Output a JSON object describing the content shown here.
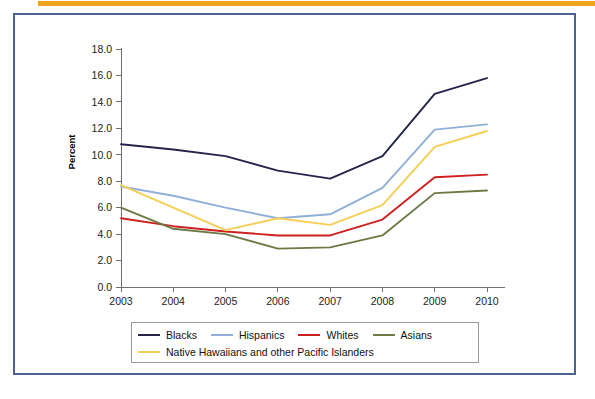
{
  "figure": {
    "accent_rule_color": "#f2a31c",
    "frame_color": "#4f6391",
    "background": "#ffffff"
  },
  "chart_data": {
    "type": "line",
    "title": "",
    "subtitle": "",
    "xlabel": "",
    "ylabel": "Percent",
    "categories": [
      "2003",
      "2004",
      "2005",
      "2006",
      "2007",
      "2008",
      "2009",
      "2010"
    ],
    "x": [
      2003,
      2004,
      2005,
      2006,
      2007,
      2008,
      2009,
      2010
    ],
    "ylim": [
      0.0,
      18.0
    ],
    "ytick_step": 2.0,
    "yticks": [
      "0.0",
      "2.0",
      "4.0",
      "6.0",
      "8.0",
      "10.0",
      "12.0",
      "14.0",
      "16.0",
      "18.0"
    ],
    "ytick_values": [
      0.0,
      2.0,
      4.0,
      6.0,
      8.0,
      10.0,
      12.0,
      14.0,
      16.0,
      18.0
    ],
    "grid": false,
    "legend_position": "bottom",
    "series": [
      {
        "name": "Blacks",
        "color": "#25254b",
        "values": [
          10.8,
          10.4,
          9.9,
          8.8,
          8.2,
          9.9,
          14.6,
          15.8
        ]
      },
      {
        "name": "Hispanics",
        "color": "#90b0d8",
        "values": [
          7.6,
          6.9,
          6.0,
          5.2,
          5.5,
          7.5,
          11.9,
          12.3
        ]
      },
      {
        "name": "Whites",
        "color": "#cf2020",
        "values": [
          5.2,
          4.6,
          4.2,
          3.9,
          3.9,
          5.1,
          8.3,
          8.5
        ]
      },
      {
        "name": "Asians",
        "color": "#6b7a45",
        "values": [
          6.0,
          4.4,
          4.0,
          2.9,
          3.0,
          3.9,
          7.1,
          7.3
        ]
      },
      {
        "name": "Native Hawaiians and other Pacific Islanders",
        "color": "#f5cf55",
        "values": [
          7.7,
          6.0,
          4.3,
          5.2,
          4.7,
          6.2,
          10.6,
          11.8
        ]
      }
    ]
  },
  "legend": {
    "row1": [
      {
        "label": "Blacks",
        "color": "#25254b"
      },
      {
        "label": "Hispanics",
        "color": "#90b0d8"
      },
      {
        "label": "Whites",
        "color": "#cf2020"
      },
      {
        "label": "Asians",
        "color": "#6b7a45"
      }
    ],
    "row2": [
      {
        "label": "Native Hawaiians and other Pacific Islanders",
        "color": "#f5cf55"
      }
    ]
  }
}
